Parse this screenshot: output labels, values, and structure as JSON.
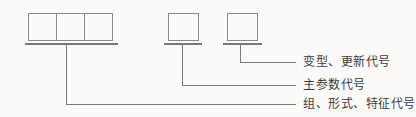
{
  "diagram": {
    "labels": {
      "variant": "变型、更新代号",
      "main_parameter": "主参数代号",
      "group_form_feature": "组、形式、特征代号"
    },
    "boxes": {
      "left_group_cell_count": 3,
      "middle_cell_count": 1,
      "right_cell_count": 1
    },
    "colors": {
      "background": "#fbfaf8",
      "box_border": "#898989",
      "underline_bar": "#787878",
      "leader_line": "#7a7a7a",
      "label_text": "#3c3c3c"
    }
  }
}
